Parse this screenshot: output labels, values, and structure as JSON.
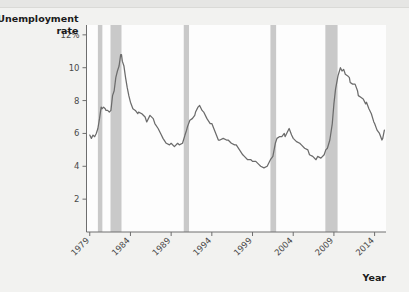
{
  "figure": {
    "background_color": "#f2f2f0",
    "plot_background_color": "#fdfdfd",
    "line_color": "#6b6b6b",
    "band_color": "#c9c9c9",
    "axis_color": "#6e6e6e"
  },
  "chart_data": {
    "type": "line",
    "title": "",
    "ylabel": "Unemployment rate",
    "xlabel": "Year",
    "ylim": [
      0,
      12.6
    ],
    "xlim": [
      1978.6,
      2015.4
    ],
    "grid": false,
    "legend": null,
    "ytick_labels": [
      "12%",
      "10",
      "8",
      "6",
      "4",
      "2"
    ],
    "ytick_values": [
      12,
      10,
      8,
      6,
      4,
      2
    ],
    "xtick_labels": [
      "1979",
      "1984",
      "1989",
      "1994",
      "1999",
      "2004",
      "2009",
      "2014"
    ],
    "xtick_values": [
      1979,
      1984,
      1989,
      1994,
      1999,
      2004,
      2009,
      2014
    ],
    "series": [
      {
        "name": "Unemployment rate",
        "x": [
          1979.0,
          1979.2,
          1979.4,
          1979.6,
          1979.8,
          1980.0,
          1980.2,
          1980.4,
          1980.5,
          1980.7,
          1980.9,
          1981.0,
          1981.2,
          1981.4,
          1981.6,
          1981.8,
          1982.0,
          1982.2,
          1982.4,
          1982.6,
          1982.8,
          1982.9,
          1983.0,
          1983.2,
          1983.4,
          1983.6,
          1983.8,
          1984.0,
          1984.3,
          1984.6,
          1984.9,
          1985.0,
          1985.4,
          1985.8,
          1986.0,
          1986.4,
          1986.8,
          1987.0,
          1987.4,
          1987.8,
          1988.0,
          1988.4,
          1988.8,
          1989.0,
          1989.4,
          1989.8,
          1990.0,
          1990.4,
          1990.7,
          1990.9,
          1991.0,
          1991.3,
          1991.6,
          1991.9,
          1992.0,
          1992.3,
          1992.5,
          1992.8,
          1993.0,
          1993.4,
          1993.8,
          1994.0,
          1994.4,
          1994.8,
          1995.0,
          1995.4,
          1995.8,
          1996.0,
          1996.4,
          1996.8,
          1997.0,
          1997.4,
          1997.8,
          1998.0,
          1998.4,
          1998.8,
          1999.0,
          1999.4,
          1999.8,
          2000.0,
          2000.4,
          2000.8,
          2001.0,
          2001.2,
          2001.5,
          2001.8,
          2002.0,
          2002.3,
          2002.6,
          2002.9,
          2003.0,
          2003.3,
          2003.5,
          2003.8,
          2004.0,
          2004.4,
          2004.8,
          2005.0,
          2005.4,
          2005.8,
          2006.0,
          2006.4,
          2006.8,
          2007.0,
          2007.4,
          2007.8,
          2008.0,
          2008.2,
          2008.5,
          2008.8,
          2009.0,
          2009.2,
          2009.5,
          2009.8,
          2010.0,
          2010.2,
          2010.4,
          2010.7,
          2010.9,
          2011.0,
          2011.3,
          2011.6,
          2011.9,
          2012.0,
          2012.3,
          2012.6,
          2012.9,
          2013.0,
          2013.3,
          2013.6,
          2013.9,
          2014.0,
          2014.3,
          2014.6,
          2014.9,
          2015.0,
          2015.2
        ],
        "y": [
          5.9,
          5.7,
          5.9,
          5.8,
          6.0,
          6.3,
          6.9,
          7.6,
          7.5,
          7.6,
          7.5,
          7.4,
          7.4,
          7.3,
          7.4,
          8.3,
          8.6,
          9.4,
          9.8,
          10.1,
          10.8,
          10.8,
          10.4,
          10.1,
          9.4,
          8.8,
          8.3,
          7.9,
          7.5,
          7.4,
          7.2,
          7.3,
          7.2,
          7.0,
          6.7,
          7.1,
          6.9,
          6.6,
          6.3,
          5.9,
          5.7,
          5.4,
          5.3,
          5.4,
          5.2,
          5.4,
          5.3,
          5.4,
          5.9,
          6.2,
          6.4,
          6.8,
          6.9,
          7.1,
          7.3,
          7.6,
          7.7,
          7.4,
          7.3,
          6.9,
          6.6,
          6.6,
          6.1,
          5.6,
          5.6,
          5.7,
          5.6,
          5.6,
          5.4,
          5.3,
          5.3,
          5.0,
          4.7,
          4.6,
          4.4,
          4.4,
          4.3,
          4.3,
          4.1,
          4.0,
          3.9,
          4.0,
          4.2,
          4.4,
          4.6,
          5.4,
          5.7,
          5.8,
          5.8,
          6.0,
          5.8,
          6.1,
          6.3,
          5.9,
          5.7,
          5.5,
          5.4,
          5.3,
          5.1,
          5.0,
          4.7,
          4.6,
          4.4,
          4.6,
          4.5,
          4.7,
          5.0,
          5.1,
          5.6,
          6.6,
          7.8,
          8.7,
          9.5,
          10.0,
          9.8,
          9.9,
          9.6,
          9.5,
          9.4,
          9.1,
          9.0,
          9.0,
          8.6,
          8.3,
          8.2,
          8.1,
          7.8,
          7.9,
          7.5,
          7.2,
          6.7,
          6.6,
          6.2,
          6.0,
          5.6,
          5.7,
          6.2
        ]
      }
    ],
    "recession_bands": [
      {
        "label": "1980 recession",
        "start": 1980.0,
        "end": 1980.55
      },
      {
        "label": "1981-1982 recession",
        "start": 1981.55,
        "end": 1982.9
      },
      {
        "label": "1990-1991 recession",
        "start": 1990.55,
        "end": 1991.2
      },
      {
        "label": "2001 recession",
        "start": 2001.2,
        "end": 2001.9
      },
      {
        "label": "2007-2009 recession",
        "start": 2007.95,
        "end": 2009.45
      }
    ]
  }
}
